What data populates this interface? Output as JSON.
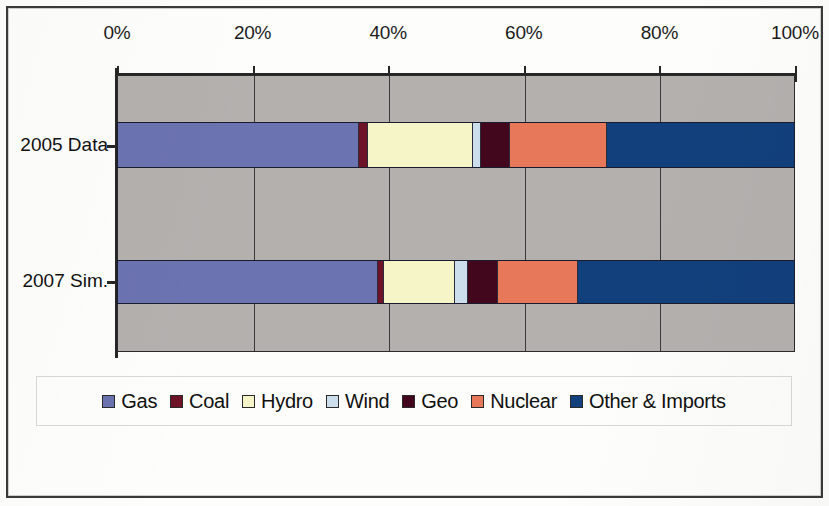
{
  "chart_data": {
    "type": "bar",
    "orientation": "horizontal",
    "stacked": true,
    "normalized": true,
    "title": "",
    "subtitle": "",
    "xlabel": "",
    "ylabel": "",
    "xlim": [
      0,
      100
    ],
    "grid": true,
    "legend_position": "bottom",
    "x_ticks": [
      {
        "value": 0,
        "label": "0%"
      },
      {
        "value": 20,
        "label": "20%"
      },
      {
        "value": 40,
        "label": "40%"
      },
      {
        "value": 60,
        "label": "60%"
      },
      {
        "value": 80,
        "label": "80%"
      },
      {
        "value": 100,
        "label": "100%"
      }
    ],
    "categories": [
      "2005 Data",
      "2007 Sim."
    ],
    "series": [
      {
        "name": "Gas",
        "color": "#6b73b0",
        "values": [
          35.7,
          38.5
        ]
      },
      {
        "name": "Coal",
        "color": "#6e1228",
        "values": [
          1.3,
          0.9
        ]
      },
      {
        "name": "Hydro",
        "color": "#f5f5c8",
        "values": [
          15.5,
          10.5
        ]
      },
      {
        "name": "Wind",
        "color": "#ccdeeb",
        "values": [
          1.2,
          1.9
        ]
      },
      {
        "name": "Geo",
        "color": "#42061d",
        "values": [
          4.3,
          4.4
        ]
      },
      {
        "name": "Nuclear",
        "color": "#e7785a",
        "values": [
          14.4,
          11.8
        ]
      },
      {
        "name": "Other & Imports",
        "color": "#12407c",
        "values": [
          27.6,
          32.0
        ]
      }
    ],
    "plot_background": "#b3b0ae"
  },
  "legend": {
    "items": [
      {
        "label": "Gas",
        "swatch_name": "legend-swatch-gas"
      },
      {
        "label": "Coal",
        "swatch_name": "legend-swatch-coal"
      },
      {
        "label": "Hydro",
        "swatch_name": "legend-swatch-hydro"
      },
      {
        "label": "Wind",
        "swatch_name": "legend-swatch-wind"
      },
      {
        "label": "Geo",
        "swatch_name": "legend-swatch-geo"
      },
      {
        "label": "Nuclear",
        "swatch_name": "legend-swatch-nuclear"
      },
      {
        "label": "Other & Imports",
        "swatch_name": "legend-swatch-other-imports"
      }
    ]
  }
}
